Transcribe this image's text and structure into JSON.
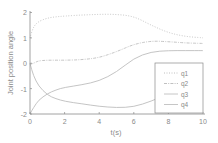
{
  "chart_data": {
    "type": "line",
    "title": "",
    "xlabel": "t(s)",
    "ylabel": "Joint position angle",
    "xlim": [
      0,
      10
    ],
    "ylim": [
      -2,
      2
    ],
    "xticks": [
      0,
      2,
      4,
      6,
      8,
      10
    ],
    "yticks": [
      -2,
      -1,
      0,
      1,
      2
    ],
    "grid": false,
    "legend_position": "lower right",
    "x": [
      0,
      0.2,
      0.5,
      1,
      1.5,
      2,
      3,
      4,
      5,
      6,
      7,
      8,
      9,
      10
    ],
    "series": [
      {
        "name": "q1",
        "style": "dotted",
        "values": [
          1.0,
          1.45,
          1.65,
          1.78,
          1.83,
          1.86,
          1.9,
          1.93,
          1.93,
          1.85,
          1.5,
          1.2,
          1.05,
          1.0
        ]
      },
      {
        "name": "q2",
        "style": "dashdot",
        "values": [
          -0.05,
          0.0,
          0.1,
          0.12,
          0.12,
          0.12,
          0.14,
          0.22,
          0.45,
          0.75,
          0.88,
          0.85,
          0.8,
          0.78
        ]
      },
      {
        "name": "q3",
        "style": "solid",
        "values": [
          -2.0,
          -1.75,
          -1.45,
          -1.2,
          -1.05,
          -0.95,
          -0.85,
          -0.7,
          -0.35,
          0.2,
          0.45,
          0.5,
          0.5,
          0.5
        ]
      },
      {
        "name": "q4",
        "style": "solid",
        "values": [
          0.0,
          -0.5,
          -0.9,
          -1.25,
          -1.4,
          -1.5,
          -1.6,
          -1.7,
          -1.75,
          -1.72,
          -1.5,
          -1.2,
          -1.0,
          -0.9
        ]
      }
    ]
  },
  "axes": {
    "xlabel": "t(s)",
    "ylabel": "Joint position angle",
    "xtick_labels": [
      "0",
      "2",
      "4",
      "6",
      "8",
      "10"
    ],
    "ytick_labels": [
      "-2",
      "-1",
      "0",
      "1",
      "2"
    ]
  },
  "legend": {
    "items": [
      {
        "label": "q1"
      },
      {
        "label": "q2"
      },
      {
        "label": "q3"
      },
      {
        "label": "q4"
      }
    ]
  },
  "colors": {
    "axis": "#8a8a8a",
    "series": "#bdbdbd"
  }
}
